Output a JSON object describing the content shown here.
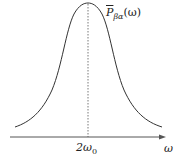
{
  "figure": {
    "curve_label": {
      "symbol": "P",
      "subscript": "βα",
      "argument": "(ω)"
    },
    "x_tick": {
      "coefficient": "2ω",
      "subscript": "0"
    },
    "x_axis_label": "ω",
    "colors": {
      "curve": "#333333",
      "axis": "#555555",
      "dotted_line": "#555555",
      "text": "#222222"
    }
  }
}
